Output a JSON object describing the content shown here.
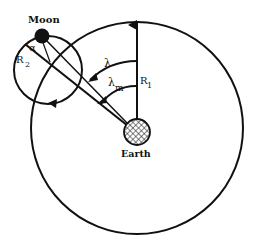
{
  "diagram": {
    "labels": {
      "moon": "Moon",
      "earth": "Earth",
      "r1": "R",
      "r1_sub": "1",
      "r2": "R",
      "r2_sub": "2",
      "lambda": "λ",
      "lambda_m": "λ",
      "lambda_m_sub": "m",
      "alpha": "α"
    },
    "colors": {
      "stroke": "#111111",
      "background": "#ffffff",
      "moon_fill": "#111111"
    }
  }
}
